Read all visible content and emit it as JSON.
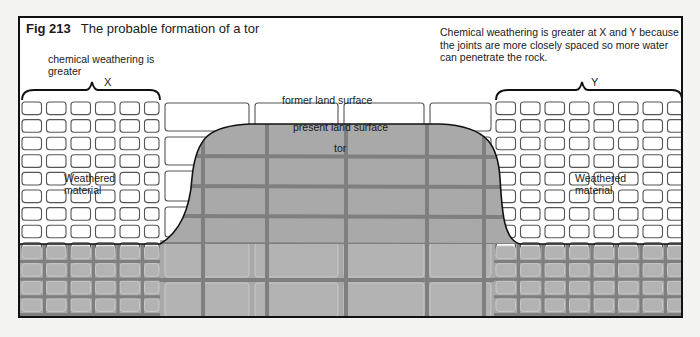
{
  "figure": {
    "number": "Fig 213",
    "title": "The probable formation of a tor",
    "note": "Chemical weathering is greater at X and Y because the joints are more closely spaced so more water can penetrate the rock.",
    "labels": {
      "chemical_weathering": "chemical weathering is greater",
      "x": "X",
      "y": "Y",
      "former_surface": "former land surface",
      "present_surface": "present land surface",
      "tor": "tor",
      "weathered_left": "Weathered material",
      "weathered_right": "Weathered material"
    },
    "colors": {
      "rock_fill": "#a9a9a9",
      "joint": "#7f7f7f",
      "outline": "#111111",
      "block_stroke": "#555555",
      "background": "#ffffff"
    }
  }
}
